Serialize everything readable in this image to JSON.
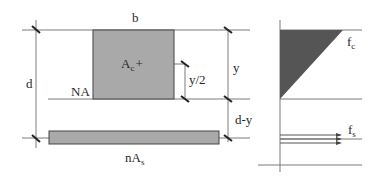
{
  "diagram": {
    "labels": {
      "width": "b",
      "depth": "d",
      "neutral_axis": "NA",
      "concrete_area_main": "A",
      "concrete_area_sub": "c",
      "centroid_marker": "+",
      "half_y": "y/2",
      "y": "y",
      "d_minus_y": "d-y",
      "steel_area_main": "nA",
      "steel_area_sub": "s",
      "fc_main": "f",
      "fc_sub": "c",
      "fs_main": "f",
      "fs_sub": "s"
    },
    "colors": {
      "concrete_fill": "#a9a9a9",
      "steel_fill": "#a9a9a9",
      "stress_fill": "#555555",
      "line": "#7a7a7a",
      "outline": "#444444"
    }
  }
}
